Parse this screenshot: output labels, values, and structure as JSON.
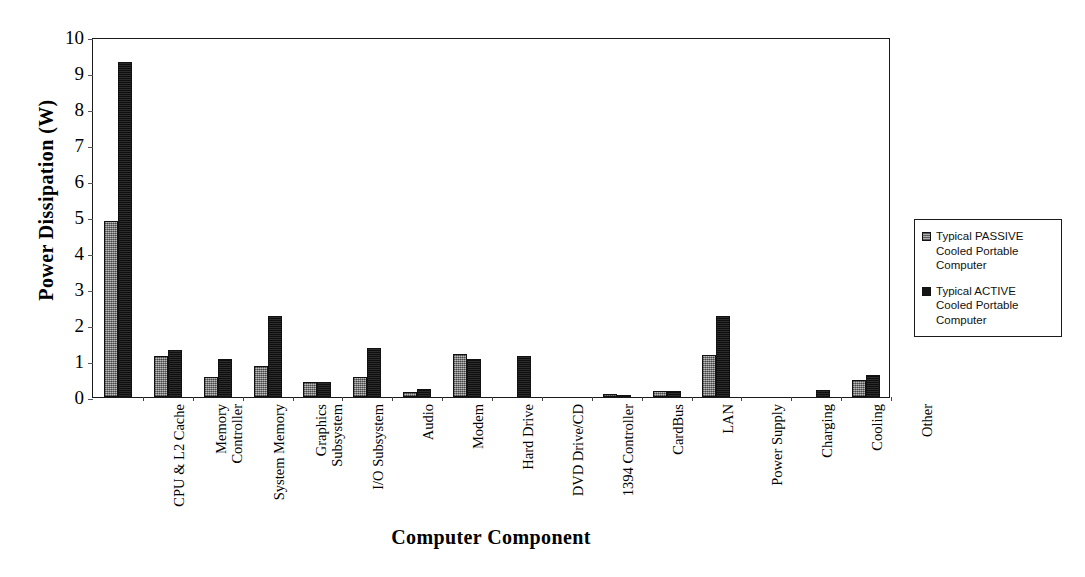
{
  "chart_data": {
    "type": "bar",
    "title": "",
    "xlabel": "Computer Component",
    "ylabel": "Power Dissipation (W)",
    "ylim": [
      0,
      10
    ],
    "yticks": [
      0,
      1,
      2,
      3,
      4,
      5,
      6,
      7,
      8,
      9,
      10
    ],
    "grid": false,
    "legend_position": "right",
    "categories": [
      "CPU & L2 Cache",
      "Memory Controller",
      "System Memory",
      "Graphics Subsystem",
      "I/O Subsystem",
      "Audio",
      "Modem",
      "Hard Drive",
      "DVD Drive/CD",
      "1394 Controller",
      "CardBus",
      "LAN",
      "Power Supply",
      "Charging",
      "Cooling",
      "Other"
    ],
    "category_lines": [
      [
        "CPU & L2 Cache"
      ],
      [
        "Memory",
        "Controller"
      ],
      [
        "System Memory"
      ],
      [
        "Graphics",
        "Subsystem"
      ],
      [
        "I/O Subsystem"
      ],
      [
        "Audio"
      ],
      [
        "Modem"
      ],
      [
        "Hard Drive"
      ],
      [
        "DVD Drive/CD"
      ],
      [
        "1394 Controller"
      ],
      [
        "CardBus"
      ],
      [
        "LAN"
      ],
      [
        "Power Supply"
      ],
      [
        "Charging"
      ],
      [
        "Cooling"
      ],
      [
        "Other"
      ]
    ],
    "series": [
      {
        "name": "Typical PASSIVE Cooled Portable Computer",
        "name_lines": [
          "Typical PASSIVE",
          "Cooled Portable",
          "Computer"
        ],
        "color": "#8c8c8c",
        "values": [
          4.9,
          1.15,
          0.55,
          0.85,
          0.42,
          0.55,
          0.15,
          1.2,
          0,
          0,
          0.07,
          0.17,
          1.17,
          0,
          0,
          0.47
        ]
      },
      {
        "name": "Typical ACTIVE Cooled Portable Computer",
        "name_lines": [
          "Typical ACTIVE",
          "Cooled Portable",
          "Computer"
        ],
        "color": "#1c1c1c",
        "values": [
          9.3,
          1.3,
          1.05,
          2.25,
          0.42,
          1.37,
          0.22,
          1.05,
          1.15,
          0,
          0.06,
          0.17,
          2.25,
          0,
          0.2,
          0.62
        ]
      }
    ]
  }
}
